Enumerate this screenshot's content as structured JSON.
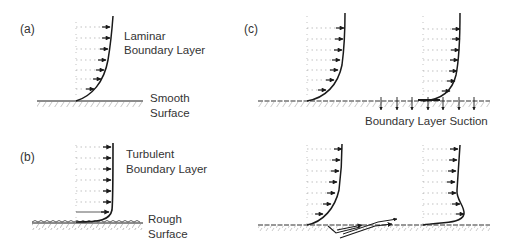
{
  "panels": {
    "a": {
      "letter": "(a)",
      "profile_label_line1": "Laminar",
      "profile_label_line2": "Boundary Layer",
      "surface_label_line1": "Smooth",
      "surface_label_line2": "Surface"
    },
    "b": {
      "letter": "(b)",
      "profile_label_line1": "Turbulent",
      "profile_label_line2": "Boundary Layer",
      "surface_label_line1": "Rough",
      "surface_label_line2": "Surface"
    },
    "c": {
      "letter": "(c)",
      "suction_label": "Boundary Layer Suction"
    }
  },
  "colors": {
    "line": "#1a1a1a",
    "dotted": "#9a9a9a",
    "background": "#ffffff"
  }
}
